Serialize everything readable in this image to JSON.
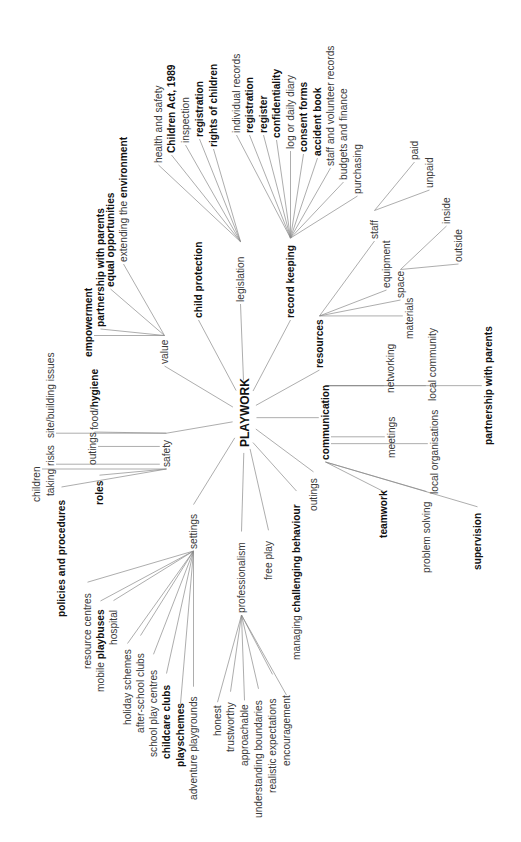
{
  "title": "PLAYWORK",
  "orientation": "rotated 90° counter-clockwise; text reads bottom-to-top",
  "center": {
    "label": "PLAYWORK",
    "x": 249,
    "y": 447
  },
  "branches": [
    {
      "id": "value",
      "label": "value",
      "bold": false,
      "x": 168,
      "y": 364,
      "children": [
        {
          "label": "empowerment",
          "bold": true,
          "x": 92,
          "y": 357
        },
        {
          "label": "partnership with parents",
          "bold": true,
          "x": 104,
          "y": 327
        },
        {
          "label": "equal opportunities",
          "bold": true,
          "x": 114,
          "y": 287
        },
        {
          "label": "extending the environment",
          "parts": [
            {
              "text": "extending the ",
              "bold": false
            },
            {
              "text": "environment",
              "bold": true
            }
          ],
          "x": 127,
          "y": 262
        }
      ]
    },
    {
      "id": "child-protection",
      "label": "child protection",
      "bold": true,
      "x": 202,
      "y": 318,
      "children": []
    },
    {
      "id": "legislation",
      "label": "legislation",
      "bold": false,
      "x": 244,
      "y": 302,
      "children": [
        {
          "label": "health and safety",
          "bold": false,
          "x": 162,
          "y": 163
        },
        {
          "label": "Children Act, 1989",
          "bold": true,
          "x": 175,
          "y": 153
        },
        {
          "label": "inspection",
          "bold": false,
          "x": 189,
          "y": 143
        },
        {
          "label": "registration",
          "bold": true,
          "x": 203,
          "y": 137
        },
        {
          "label": "rights of children",
          "bold": true,
          "x": 217,
          "y": 147
        }
      ]
    },
    {
      "id": "record-keeping",
      "label": "record keeping",
      "bold": true,
      "x": 294,
      "y": 318,
      "children": [
        {
          "label": "individual records",
          "bold": false,
          "x": 240,
          "y": 133
        },
        {
          "label": "registration",
          "bold": true,
          "x": 253,
          "y": 133
        },
        {
          "label": "register",
          "bold": true,
          "x": 267,
          "y": 133
        },
        {
          "label": "confidentiality",
          "bold": true,
          "x": 280,
          "y": 138
        },
        {
          "label": "log or daily diary",
          "bold": false,
          "x": 294,
          "y": 149
        },
        {
          "label": "consent forms",
          "bold": true,
          "x": 307,
          "y": 152
        },
        {
          "label": "accident book",
          "bold": true,
          "x": 321,
          "y": 156
        },
        {
          "label": "staff and volunteer records",
          "bold": false,
          "x": 334,
          "y": 166
        },
        {
          "label": "budgets and finance",
          "bold": false,
          "x": 347,
          "y": 180
        },
        {
          "label": "purchasing",
          "bold": false,
          "x": 361,
          "y": 194
        }
      ]
    },
    {
      "id": "resources",
      "label": "resources",
      "bold": true,
      "x": 323,
      "y": 368,
      "children": [
        {
          "id": "staff",
          "label": "staff",
          "bold": false,
          "x": 378,
          "y": 239,
          "children": [
            {
              "label": "paid",
              "bold": false,
              "x": 418,
              "y": 160
            },
            {
              "label": "unpaid",
              "bold": false,
              "x": 433,
              "y": 188
            }
          ]
        },
        {
          "label": "equipment",
          "bold": false,
          "x": 390,
          "y": 288
        },
        {
          "id": "space",
          "label": "space",
          "bold": false,
          "x": 404,
          "y": 298,
          "children": [
            {
              "label": "inside",
              "bold": false,
              "x": 450,
              "y": 224
            },
            {
              "label": "outside",
              "bold": false,
              "x": 462,
              "y": 262
            }
          ]
        },
        {
          "label": "materials",
          "bold": false,
          "x": 413,
          "y": 339
        }
      ]
    },
    {
      "id": "communication",
      "label": "communication",
      "bold": true,
      "x": 329,
      "y": 460,
      "children": [
        {
          "label": "networking",
          "bold": false,
          "x": 394,
          "y": 393
        },
        {
          "label": "local community",
          "bold": false,
          "x": 436,
          "y": 401
        },
        {
          "label": "partnership with parents",
          "bold": true,
          "x": 492,
          "y": 445
        },
        {
          "label": "meetings",
          "bold": false,
          "x": 395,
          "y": 458
        },
        {
          "label": "local organisations",
          "bold": false,
          "x": 438,
          "y": 494
        },
        {
          "label": "teamwork",
          "bold": true,
          "x": 387,
          "y": 538
        },
        {
          "label": "problem solving",
          "bold": false,
          "x": 430,
          "y": 573
        },
        {
          "label": "supervision",
          "bold": true,
          "x": 481,
          "y": 570
        }
      ]
    },
    {
      "id": "outings",
      "label": "outings",
      "bold": false,
      "x": 317,
      "y": 511,
      "children": []
    },
    {
      "id": "managing-challenging-behaviour",
      "label": "managing challenging behaviour",
      "parts": [
        {
          "text": "managing ",
          "bold": false
        },
        {
          "text": "challenging behaviour",
          "bold": true
        }
      ],
      "x": 300,
      "y": 660,
      "children": []
    },
    {
      "id": "free-play",
      "label": "free play",
      "bold": false,
      "x": 272,
      "y": 580,
      "children": []
    },
    {
      "id": "professionalism",
      "label": "professionalism",
      "bold": false,
      "x": 245,
      "y": 613,
      "children": [
        {
          "label": "honest",
          "bold": false,
          "x": 221,
          "y": 736
        },
        {
          "label": "trustworthy",
          "bold": false,
          "x": 234,
          "y": 752
        },
        {
          "label": "approachable",
          "bold": false,
          "x": 248,
          "y": 766
        },
        {
          "label": "understanding boundaries",
          "bold": false,
          "x": 262,
          "y": 818
        },
        {
          "label": "realistic expectations",
          "bold": false,
          "x": 276,
          "y": 793
        },
        {
          "label": "encouragement",
          "bold": false,
          "x": 290,
          "y": 766
        }
      ]
    },
    {
      "id": "settings",
      "label": "settings",
      "bold": false,
      "x": 197,
      "y": 549,
      "children": [
        {
          "label": "resource centres",
          "bold": false,
          "x": 91,
          "y": 669
        },
        {
          "label": "mobile playbuses",
          "parts": [
            {
              "text": "mobile ",
              "bold": false
            },
            {
              "text": "playbuses",
              "bold": true
            }
          ],
          "x": 104,
          "y": 692
        },
        {
          "label": "hospital",
          "bold": false,
          "x": 117,
          "y": 645
        },
        {
          "label": "holiday schemes",
          "bold": false,
          "x": 131,
          "y": 725
        },
        {
          "label": "after-school clubs",
          "bold": false,
          "x": 144,
          "y": 733
        },
        {
          "label": "school play centres",
          "bold": false,
          "x": 157,
          "y": 757
        },
        {
          "label": "childcare clubs",
          "bold": true,
          "x": 170,
          "y": 759
        },
        {
          "label": "playschemes",
          "bold": true,
          "x": 184,
          "y": 767
        },
        {
          "label": "adventure playgrounds",
          "bold": false,
          "x": 197,
          "y": 800
        }
      ]
    },
    {
      "id": "safety",
      "label": "safety",
      "bold": false,
      "x": 170,
      "y": 467,
      "children": [
        {
          "label": "food/hygiene",
          "parts": [
            {
              "text": "food/",
              "bold": false
            },
            {
              "text": "hygiene",
              "bold": true
            }
          ],
          "x": 98,
          "y": 430
        },
        {
          "label": "site/building issues",
          "bold": false,
          "x": 54,
          "y": 438
        },
        {
          "label": "outings",
          "bold": false,
          "x": 96,
          "y": 465
        },
        {
          "label": "children",
          "bold": false,
          "x": 40,
          "y": 502
        },
        {
          "label": "taking risks",
          "bold": false,
          "x": 54,
          "y": 496
        },
        {
          "label": "roles",
          "bold": true,
          "x": 103,
          "y": 505
        },
        {
          "label": "policies and procedures",
          "bold": true,
          "x": 65,
          "y": 617
        }
      ]
    }
  ]
}
